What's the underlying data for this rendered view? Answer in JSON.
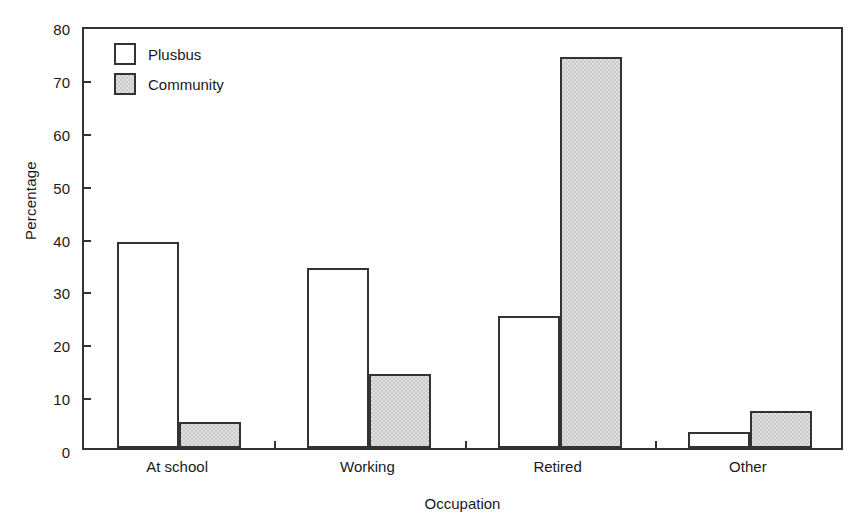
{
  "chart_data": {
    "type": "bar",
    "title": "",
    "subtitle": "",
    "xlabel": "Occupation",
    "ylabel": "Percentage",
    "categories": [
      "At school",
      "Working",
      "Retired",
      "Other"
    ],
    "series": [
      {
        "name": "Plusbus",
        "values": [
          39,
          34,
          25,
          3
        ],
        "fill": "#ffffff",
        "edge": "#333333"
      },
      {
        "name": "Community",
        "values": [
          5,
          14,
          74,
          7
        ],
        "fill": "#c9c9c9",
        "edge": "#333333"
      }
    ],
    "ylim": [
      0,
      80
    ],
    "yticks": [
      0,
      10,
      20,
      30,
      40,
      50,
      60,
      70,
      80
    ],
    "ytick_labels": [
      "0",
      "10",
      "20",
      "30",
      "40",
      "50",
      "60",
      "70",
      "80"
    ],
    "grid": false,
    "legend_position": "top-left",
    "frame": "box"
  },
  "legend": {
    "entries": [
      {
        "label": "Plusbus"
      },
      {
        "label": "Community"
      }
    ]
  },
  "axes": {
    "y_title": "Percentage",
    "x_title": "Occupation"
  }
}
